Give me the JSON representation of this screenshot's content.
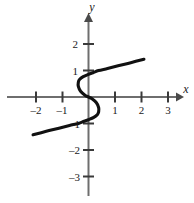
{
  "figure": {
    "background_color": "#ffffff",
    "curve_color": "#111111",
    "axis_color": "#6e6e6e",
    "tick_color": "#3a3a3a"
  },
  "chart_data": {
    "type": "line",
    "title": "",
    "subtitle": "",
    "xlabel": "x",
    "ylabel": "y",
    "xlim": [
      -2.6,
      3.6
    ],
    "ylim": [
      -3.6,
      2.6
    ],
    "grid": false,
    "legend": null,
    "x_ticks": [
      -2,
      -1,
      1,
      2,
      3
    ],
    "x_tick_labels": [
      "-2",
      "-1",
      "1",
      "2",
      "3"
    ],
    "y_ticks": [
      2,
      1,
      -1,
      -2,
      -3
    ],
    "y_tick_labels": [
      "2",
      "1",
      "-1",
      "-2",
      "-3"
    ],
    "relation": "x = y^3 - y",
    "series": [
      {
        "name": "cubic-relation",
        "points_xy": [
          [
            2.1,
            1.43
          ],
          [
            1.6,
            1.3
          ],
          [
            1.12,
            1.18
          ],
          [
            0.72,
            1.08
          ],
          [
            0.38,
            1.0
          ],
          [
            0.19,
            0.93
          ],
          [
            0.0,
            0.86
          ],
          [
            -0.2,
            0.77
          ],
          [
            -0.34,
            0.66
          ],
          [
            -0.385,
            0.56
          ],
          [
            -0.385,
            0.4
          ],
          [
            -0.3,
            0.22
          ],
          [
            -0.12,
            0.06
          ],
          [
            0.0,
            0.0
          ],
          [
            0.12,
            -0.06
          ],
          [
            0.3,
            -0.22
          ],
          [
            0.385,
            -0.4
          ],
          [
            0.385,
            -0.56
          ],
          [
            0.34,
            -0.66
          ],
          [
            0.2,
            -0.77
          ],
          [
            0.0,
            -0.86
          ],
          [
            -0.19,
            -0.93
          ],
          [
            -0.38,
            -1.0
          ],
          [
            -0.72,
            -1.08
          ],
          [
            -1.12,
            -1.18
          ],
          [
            -1.6,
            -1.3
          ],
          [
            -2.1,
            -1.43
          ]
        ]
      }
    ]
  },
  "labels": {
    "x_axis": "x",
    "y_axis": "y",
    "x_neg2": "–2",
    "x_neg1": "–1",
    "x_1": "1",
    "x_2": "2",
    "x_3": "3",
    "y_2": "2",
    "y_1": "1",
    "y_neg1": "–1",
    "y_neg2": "–2",
    "y_neg3": "–3"
  }
}
